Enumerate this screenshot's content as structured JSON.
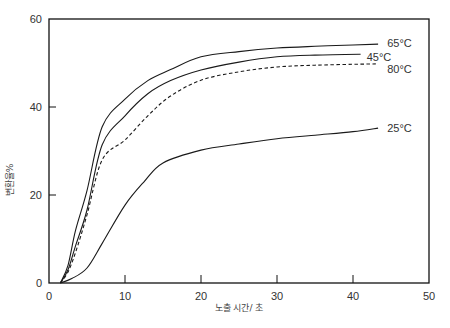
{
  "chart_data": {
    "type": "line",
    "title": "",
    "xlabel": "노출 시간/ 초",
    "ylabel": "변환율%",
    "xlim": [
      0,
      50
    ],
    "ylim": [
      0,
      60
    ],
    "xticks": [
      0,
      10,
      20,
      30,
      40,
      50
    ],
    "yticks": [
      0,
      20,
      40,
      60
    ],
    "grid": false,
    "legend": "inline labels at line ends",
    "series": [
      {
        "name": "65°C",
        "style": "solid",
        "x": [
          1.5,
          2.5,
          3.5,
          5,
          7,
          10,
          13,
          16,
          20,
          25,
          30,
          35,
          40,
          43.3
        ],
        "y": [
          0,
          4,
          12,
          21,
          35.5,
          41.8,
          46,
          48.5,
          51.4,
          52.6,
          53.4,
          53.8,
          54.1,
          54.3
        ]
      },
      {
        "name": "45°C",
        "style": "solid",
        "x": [
          1.5,
          2.5,
          3.5,
          5,
          7,
          10,
          13,
          16,
          20,
          25,
          30,
          35,
          41
        ],
        "y": [
          0,
          3,
          8.5,
          16.6,
          31.4,
          38,
          43,
          46,
          48.4,
          50.2,
          51.4,
          51.8,
          52
        ]
      },
      {
        "name": "80°C",
        "style": "dashed",
        "x": [
          1.5,
          2.5,
          3.5,
          5,
          7,
          10,
          13,
          16,
          20,
          25,
          30,
          35,
          40,
          43
        ],
        "y": [
          0,
          2.5,
          7,
          15.5,
          28,
          32.5,
          38,
          42.5,
          46.1,
          48,
          49.1,
          49.5,
          49.7,
          49.8
        ]
      },
      {
        "name": "25°C",
        "style": "solid",
        "x": [
          1.5,
          3,
          5,
          7,
          10,
          12.5,
          15,
          20,
          25,
          30,
          35,
          40,
          43.3
        ],
        "y": [
          0,
          1,
          3.4,
          9,
          17.7,
          23,
          27.3,
          30.2,
          31.6,
          32.8,
          33.6,
          34.4,
          35.2
        ]
      }
    ],
    "annotations": [
      {
        "text": "65°C",
        "x": 44.5,
        "y": 54.6
      },
      {
        "text": "45°C",
        "x": 41.8,
        "y": 51.3
      },
      {
        "text": "80°C",
        "x": 44.5,
        "y": 48.6
      },
      {
        "text": "25°C",
        "x": 44.5,
        "y": 35.2
      }
    ]
  },
  "axes": {
    "x_title": "노출 시간/ 초",
    "y_title": "변환율%",
    "x_tick_labels": [
      "0",
      "10",
      "20",
      "30",
      "40",
      "50"
    ],
    "y_tick_labels": [
      "0",
      "20",
      "40",
      "60"
    ]
  },
  "colors": {
    "line": "#1a1a1a",
    "axis": "#111111",
    "text": "#333333"
  }
}
